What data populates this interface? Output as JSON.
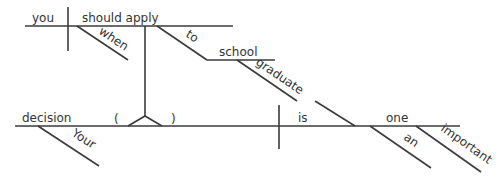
{
  "diagram": {
    "type": "Reed-Kellogg sentence diagram",
    "sentence_words": {
      "your": "Your",
      "decision": "decision",
      "is": "is",
      "one": "one",
      "an": "an",
      "important": "important",
      "you": "you",
      "should_apply": "should apply",
      "when": "when",
      "to": "to",
      "school": "school",
      "graduate": "graduate"
    },
    "main_clause": {
      "subject": "decision",
      "subject_modifier": "Your",
      "verb": "is",
      "predicate_nominative": "one",
      "predicate_modifiers": [
        "an",
        "important"
      ]
    },
    "noun_clause": {
      "subject": "you",
      "verb": "should apply",
      "adverb": "when",
      "preposition": "to",
      "object_of_preposition": "school",
      "object_modifier": "graduate"
    },
    "pedestal": {
      "open_paren": "(",
      "close_paren": ")"
    },
    "colors": {
      "line": "#3a3a3a",
      "text": "#333333",
      "background": "#ffffff"
    }
  }
}
